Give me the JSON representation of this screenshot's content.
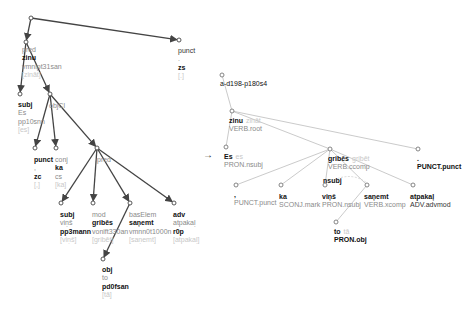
{
  "left_tree": {
    "root": {
      "x": 31,
      "y": 18
    },
    "nodes": [
      {
        "id": "pred",
        "x": 26,
        "y": 42,
        "lines": [
          {
            "t": "pred",
            "c": "g"
          },
          {
            "t": "zinu",
            "c": "b"
          },
          {
            "t": "vmnipt31san",
            "c": "g"
          },
          {
            "t": "[zināt]",
            "c": "lg"
          }
        ],
        "tx": 22,
        "ty": 46
      },
      {
        "id": "punct_top",
        "x": 179,
        "y": 40,
        "lines": [
          {
            "t": "punct",
            "c": "n"
          },
          {
            "t": ".",
            "c": "g"
          },
          {
            "t": "zs",
            "c": "b"
          },
          {
            "t": "[.]",
            "c": "lg"
          }
        ],
        "tx": 178,
        "ty": 47
      },
      {
        "id": "subj_es",
        "x": 20,
        "y": 94,
        "lines": [
          {
            "t": "subj",
            "c": "b"
          },
          {
            "t": "Es",
            "c": "g"
          },
          {
            "t": "pp10snn",
            "c": "g"
          },
          {
            "t": "[es]",
            "c": "lg"
          }
        ],
        "tx": 18,
        "ty": 101
      },
      {
        "id": "objcl",
        "x": 50,
        "y": 94,
        "lines": [
          {
            "t": "objCl",
            "c": "g"
          }
        ],
        "tx": 49,
        "ty": 102
      },
      {
        "id": "punct_comma",
        "x": 35,
        "y": 148,
        "lines": [
          {
            "t": "punct",
            "c": "b"
          },
          {
            "t": ",",
            "c": "g"
          },
          {
            "t": "zc",
            "c": "b"
          },
          {
            "t": "[,]",
            "c": "lg"
          }
        ],
        "tx": 34,
        "ty": 156
      },
      {
        "id": "conj_ka",
        "x": 56,
        "y": 148,
        "lines": [
          {
            "t": "conj",
            "c": "g"
          },
          {
            "t": "ka",
            "c": "b"
          },
          {
            "t": "cs",
            "c": "g"
          },
          {
            "t": "[ka]",
            "c": "lg"
          }
        ],
        "tx": 55,
        "ty": 156
      },
      {
        "id": "pred_gribes",
        "x": 97,
        "y": 148,
        "lines": [
          {
            "t": "pred",
            "c": "g"
          }
        ],
        "tx": 97,
        "ty": 156
      },
      {
        "id": "subj_vins",
        "x": 61,
        "y": 203,
        "lines": [
          {
            "t": "subj",
            "c": "b"
          },
          {
            "t": "viņš",
            "c": "g"
          },
          {
            "t": "pp3mann",
            "c": "b"
          },
          {
            "t": "[viņš]",
            "c": "lg"
          }
        ],
        "tx": 60,
        "ty": 211
      },
      {
        "id": "mod_gribes",
        "x": 93,
        "y": 203,
        "lines": [
          {
            "t": "mod",
            "c": "g"
          },
          {
            "t": "gribēs",
            "c": "b"
          },
          {
            "t": "vonift330an",
            "c": "g"
          },
          {
            "t": "[gribēt]",
            "c": "lg"
          }
        ],
        "tx": 92,
        "ty": 211
      },
      {
        "id": "baselem",
        "x": 130,
        "y": 203,
        "lines": [
          {
            "t": "basElem",
            "c": "g"
          },
          {
            "t": "saņemt",
            "c": "b"
          },
          {
            "t": "vmnn0t1000n",
            "c": "g"
          },
          {
            "t": "[saņemt]",
            "c": "lg"
          }
        ],
        "tx": 129,
        "ty": 211
      },
      {
        "id": "adv",
        "x": 174,
        "y": 203,
        "lines": [
          {
            "t": "adv",
            "c": "b"
          },
          {
            "t": "atpakaļ",
            "c": "g"
          },
          {
            "t": "r0p",
            "c": "b"
          },
          {
            "t": "[atpakaļ]",
            "c": "lg"
          }
        ],
        "tx": 173,
        "ty": 211
      },
      {
        "id": "obj_to",
        "x": 103,
        "y": 259,
        "lines": [
          {
            "t": "obj",
            "c": "b"
          },
          {
            "t": "to",
            "c": "g"
          },
          {
            "t": "pd0fsan",
            "c": "b"
          },
          {
            "t": "[tā]",
            "c": "lg"
          }
        ],
        "tx": 102,
        "ty": 266
      }
    ],
    "edges": [
      [
        "root",
        "pred"
      ],
      [
        "root",
        "punct_top"
      ],
      [
        "pred",
        "subj_es"
      ],
      [
        "pred",
        "objcl"
      ],
      [
        "objcl",
        "punct_comma"
      ],
      [
        "objcl",
        "conj_ka"
      ],
      [
        "objcl",
        "pred_gribes"
      ],
      [
        "pred_gribes",
        "subj_vins"
      ],
      [
        "pred_gribes",
        "mod_gribes"
      ],
      [
        "pred_gribes",
        "baselem"
      ],
      [
        "pred_gribes",
        "adv"
      ],
      [
        "baselem",
        "obj_to"
      ]
    ]
  },
  "arrow_symbol": "→",
  "right_tree": {
    "root": {
      "x": 222,
      "y": 75,
      "label": "a-d198-p180s4",
      "tx": 220,
      "ty": 80
    },
    "nodes": [
      {
        "id": "zinu",
        "x": 232,
        "y": 111,
        "word": "zinu",
        "lemma": "zināt",
        "tag": "VERB.root",
        "tx": 229,
        "ty": 117
      },
      {
        "id": "es",
        "x": 226,
        "y": 147,
        "word": "Es",
        "lemma": "es",
        "tag": "PRON.nsubj",
        "tx": 224,
        "ty": 153
      },
      {
        "id": "gribes",
        "x": 330,
        "y": 149,
        "word": "gribēs",
        "lemma": "gribēt",
        "tag": "VERB.ccomp",
        "tx": 328,
        "ty": 155
      },
      {
        "id": "punct_end",
        "x": 418,
        "y": 149,
        "word": ".",
        "lemma": "",
        "tag": "PUNCT.punct",
        "tx": 417,
        "ty": 155
      },
      {
        "id": "comma",
        "x": 236,
        "y": 185,
        "word": ",",
        "lemma": "",
        "tag": "PUNCT.punct",
        "tx": 234,
        "ty": 191
      },
      {
        "id": "ka",
        "x": 281,
        "y": 185,
        "word": "ka",
        "lemma": "",
        "tag": "SCONJ.mark",
        "tx": 279,
        "ty": 193
      },
      {
        "id": "vins",
        "x": 325,
        "y": 185,
        "word": "viņš",
        "lemma": "",
        "tag": "PRON.nsubj",
        "tx": 322,
        "ty": 193,
        "extra": "nsubj"
      },
      {
        "id": "sanemt",
        "x": 367,
        "y": 185,
        "word": "saņemt",
        "lemma": "",
        "tag": "VERB.xcomp",
        "tx": 364,
        "ty": 193
      },
      {
        "id": "atpakal",
        "x": 413,
        "y": 185,
        "word": "atpakaļ",
        "lemma": "",
        "tag": "ADV.advmod",
        "tx": 410,
        "ty": 193
      },
      {
        "id": "to",
        "x": 336,
        "y": 222,
        "word": "to",
        "lemma": "tā",
        "tag": "PRON.obj",
        "tx": 334,
        "ty": 228
      }
    ],
    "edges": [
      [
        "root",
        "zinu"
      ],
      [
        "zinu",
        "es"
      ],
      [
        "zinu",
        "gribes"
      ],
      [
        "zinu",
        "punct_end"
      ],
      [
        "gribes",
        "comma"
      ],
      [
        "gribes",
        "ka"
      ],
      [
        "gribes",
        "vins"
      ],
      [
        "gribes",
        "sanemt"
      ],
      [
        "gribes",
        "atpakal"
      ],
      [
        "sanemt",
        "to"
      ]
    ]
  }
}
